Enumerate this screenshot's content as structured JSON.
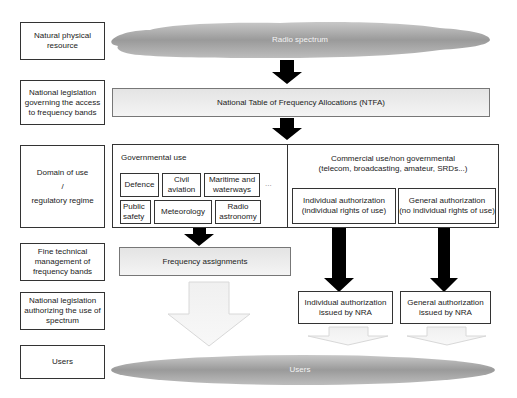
{
  "row_labels": [
    "Natural physical resource",
    "National legislation governing the access to frequency bands",
    "Domain of use / regulatory regime",
    "Fine technical management of frequency bands",
    "National legislation authorizing the use of spectrum",
    "Users"
  ],
  "domain_label": {
    "line1": "Domain of use",
    "line2": "/",
    "line3": "regulatory regime"
  },
  "cloud_top": "Radio spectrum",
  "ntfa": "National Table of Frequency Allocations (NTFA)",
  "governmental": {
    "title": "Governmental use",
    "items": [
      "Defence",
      "Civil aviation",
      "Maritime and waterways",
      "Public safety",
      "Meteorology",
      "Radio astronomy"
    ],
    "ellipsis": "..."
  },
  "commercial": {
    "title": "Commercial use/non governmental",
    "subtitle": "(telecom, broadcasting, amateur, SRDs...)",
    "individual": {
      "line1": "Individual authorization",
      "line2": "(individual rights of use)"
    },
    "general": {
      "line1": "General authorization",
      "line2": "(no individual rights of use)"
    }
  },
  "frequency_assignments": "Frequency assignments",
  "issued": {
    "individual": {
      "line1": "Individual authorization",
      "line2": "issued by NRA"
    },
    "general": {
      "line1": "General authorization",
      "line2": "issued by NRA"
    }
  },
  "cloud_bottom": "Users"
}
